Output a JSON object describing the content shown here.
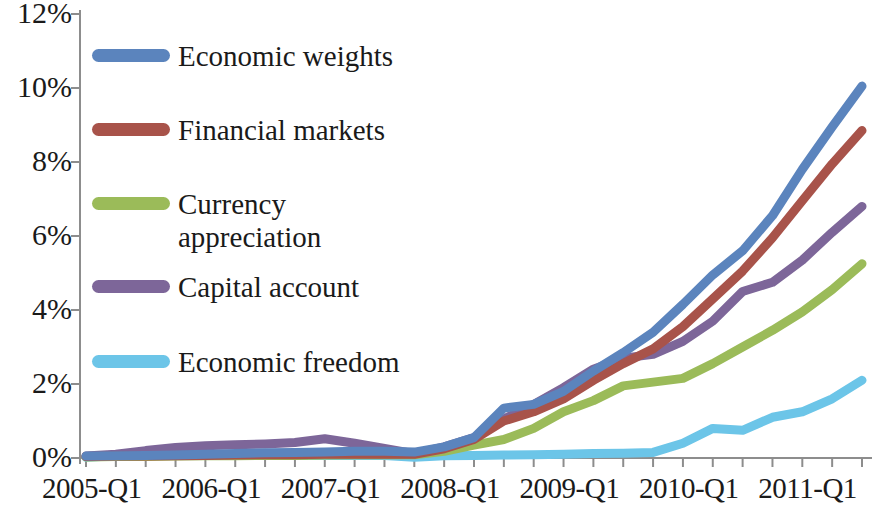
{
  "chart_data": {
    "type": "line",
    "title": "",
    "xlabel": "",
    "ylabel": "",
    "ylim": [
      0,
      12
    ],
    "yticks": [
      "0%",
      "2%",
      "4%",
      "6%",
      "8%",
      "10%",
      "12%"
    ],
    "ytick_values": [
      0,
      2,
      4,
      6,
      8,
      10,
      12
    ],
    "grid": false,
    "legend_position": "upper-left-inside",
    "x": [
      "2005-Q1",
      "2005-Q2",
      "2005-Q3",
      "2005-Q4",
      "2006-Q1",
      "2006-Q2",
      "2006-Q3",
      "2006-Q4",
      "2007-Q1",
      "2007-Q2",
      "2007-Q3",
      "2007-Q4",
      "2008-Q1",
      "2008-Q2",
      "2008-Q3",
      "2008-Q4",
      "2009-Q1",
      "2009-Q2",
      "2009-Q3",
      "2009-Q4",
      "2010-Q1",
      "2010-Q2",
      "2010-Q3",
      "2010-Q4",
      "2011-Q1",
      "2011-Q2",
      "2011-Q3"
    ],
    "xtick_labels": [
      "2005-Q1",
      "2006-Q1",
      "2007-Q1",
      "2008-Q1",
      "2009-Q1",
      "2010-Q1",
      "2011-Q1"
    ],
    "series": [
      {
        "name": "Economic weights",
        "color": "#5b84bd",
        "values": [
          0.05,
          0.06,
          0.07,
          0.08,
          0.1,
          0.12,
          0.14,
          0.15,
          0.16,
          0.18,
          0.18,
          0.16,
          0.3,
          0.55,
          1.35,
          1.45,
          1.8,
          2.35,
          2.85,
          3.4,
          4.15,
          4.95,
          5.6,
          6.55,
          7.8,
          8.95,
          10.05
        ]
      },
      {
        "name": "Financial markets",
        "color": "#a8534a",
        "values": [
          0.04,
          0.05,
          0.05,
          0.06,
          0.07,
          0.08,
          0.09,
          0.09,
          0.1,
          0.11,
          0.1,
          0.1,
          0.25,
          0.5,
          1.0,
          1.25,
          1.6,
          2.1,
          2.55,
          2.95,
          3.55,
          4.3,
          5.05,
          5.95,
          6.95,
          7.95,
          8.85
        ]
      },
      {
        "name": "Currency\nappreciation",
        "name_plain": "Currency appreciation",
        "color": "#9bbb59",
        "values": [
          0.03,
          0.04,
          0.04,
          0.05,
          0.06,
          0.06,
          0.07,
          0.07,
          0.08,
          0.09,
          0.09,
          0.09,
          0.18,
          0.35,
          0.5,
          0.8,
          1.25,
          1.55,
          1.95,
          2.05,
          2.15,
          2.55,
          3.0,
          3.45,
          3.95,
          4.55,
          5.25
        ]
      },
      {
        "name": "Capital account",
        "color": "#7d6699",
        "values": [
          0.05,
          0.1,
          0.2,
          0.28,
          0.33,
          0.36,
          0.38,
          0.42,
          0.52,
          0.4,
          0.26,
          0.12,
          0.3,
          0.55,
          1.05,
          1.45,
          1.9,
          2.4,
          2.7,
          2.8,
          3.15,
          3.7,
          4.5,
          4.75,
          5.35,
          6.1,
          6.8
        ]
      },
      {
        "name": "Economic freedom",
        "color": "#6cc5e8",
        "values": [
          0.02,
          0.06,
          0.07,
          0.07,
          0.07,
          0.07,
          0.07,
          0.07,
          0.07,
          0.07,
          0.07,
          0.02,
          0.06,
          0.07,
          0.08,
          0.09,
          0.1,
          0.12,
          0.13,
          0.15,
          0.4,
          0.8,
          0.75,
          1.1,
          1.25,
          1.6,
          2.1
        ]
      }
    ]
  },
  "axis": {
    "ytick_labels": [
      "12%",
      "10%",
      "8%",
      "6%",
      "4%",
      "2%",
      "0%"
    ],
    "xtick_labels": [
      "2005-Q1",
      "2006-Q1",
      "2007-Q1",
      "2008-Q1",
      "2009-Q1",
      "2010-Q1",
      "2011-Q1"
    ]
  },
  "legend": {
    "items": [
      {
        "label": "Economic weights",
        "color": "#5b84bd"
      },
      {
        "label": "Financial markets",
        "color": "#a8534a"
      },
      {
        "label": "Currency\nappreciation",
        "color": "#9bbb59"
      },
      {
        "label": "Capital account",
        "color": "#7d6699"
      },
      {
        "label": "Economic freedom",
        "color": "#6cc5e8"
      }
    ]
  }
}
